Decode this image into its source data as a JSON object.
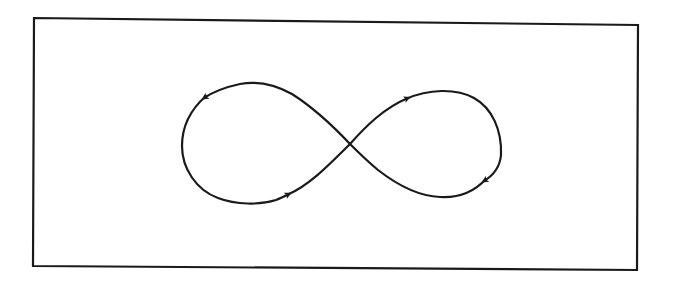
{
  "figure": {
    "background_color": "#ffffff",
    "stroke_color": "#1a1a1a",
    "frame": {
      "top_left": [
        34,
        18
      ],
      "top_right": [
        638,
        25
      ],
      "bottom_right": [
        637,
        270
      ],
      "bottom_left": [
        33,
        266
      ],
      "stroke_width": 2.2
    },
    "curve": {
      "shape": "lemniscate (figure eight)",
      "crossing_point": [
        350,
        144
      ],
      "left_loop": {
        "left_x": 182,
        "top_y": 83,
        "bottom_y": 203
      },
      "right_loop": {
        "right_x": 501,
        "top_y": 91,
        "bottom_y": 197
      },
      "stroke_width": 2.2,
      "arrows": [
        {
          "position": "left loop, upper-left",
          "at": [
            204,
            98
          ],
          "direction": "down-left"
        },
        {
          "position": "left loop, lower-right",
          "at": [
            289,
            194
          ],
          "direction": "up-right"
        },
        {
          "position": "right loop, upper-left",
          "at": [
            408,
            98
          ],
          "direction": "up-right"
        },
        {
          "position": "right loop, lower-right",
          "at": [
            484,
            181
          ],
          "direction": "down-left"
        }
      ]
    }
  }
}
